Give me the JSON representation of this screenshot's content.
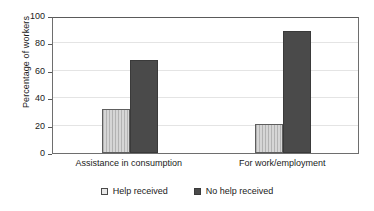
{
  "chart_data": {
    "type": "bar",
    "title": "",
    "subtitle": "",
    "xlabel": "",
    "ylabel": "Percentage of workers",
    "categories": [
      "Assistance in consumption",
      "For work/employment"
    ],
    "series": [
      {
        "name": "Help received",
        "values": [
          32,
          21
        ],
        "color": "#d6d6d6"
      },
      {
        "name": "No help received",
        "values": [
          68,
          89
        ],
        "color": "#4a4a4a"
      }
    ],
    "ylim": [
      0,
      100
    ],
    "yticks": [
      0,
      20,
      40,
      60,
      80,
      100
    ],
    "ytick_labels": [
      "0",
      "20",
      "40",
      "60",
      "80",
      "100"
    ],
    "grid": true,
    "grid_axis": "y",
    "legend_position": "bottom"
  },
  "legend": {
    "items": [
      {
        "label": "Help received",
        "swatch": "light-square-swatch"
      },
      {
        "label": "No help received",
        "swatch": "dark-square-swatch"
      }
    ]
  },
  "colors": {
    "series_light": "#d6d6d6",
    "series_dark": "#4a4a4a",
    "axis": "#5a5a5a",
    "gridline": "#e4e4e4",
    "text": "#1a1a1a",
    "background": "#ffffff"
  }
}
